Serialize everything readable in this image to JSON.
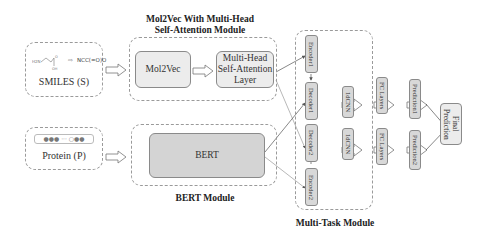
{
  "inputs": {
    "smiles": {
      "label": "SMILES (S)",
      "molecule_sketch": "H2N-CH2-C(=O)-OH",
      "smiles_string": "NCC(=O)O"
    },
    "protein": {
      "label": "Protein (P)",
      "sequence_glyph": "●●● ··· ○●●"
    }
  },
  "modules": {
    "mol2vec_module": {
      "title_line1": "Mol2Vec With Multi-Head",
      "title_line2": "Self-Attention Module",
      "blocks": [
        "Mol2Vec",
        "Multi-Head Self-Attention Layer"
      ]
    },
    "bert_module": {
      "title": "BERT Module",
      "blocks": [
        "BERT"
      ]
    },
    "multitask_module": {
      "title": "Multi-Task Module",
      "encoders_decoders": [
        "Encoder1",
        "Decoder1",
        "Decoder2",
        "Encoder2"
      ],
      "cnn": [
        "1dCNN",
        "1dCNN"
      ],
      "fc": [
        "FC Layers",
        "FC Layers"
      ],
      "predictions": [
        "Prediction1",
        "Prediction2"
      ],
      "final": "Final Prediction"
    }
  },
  "colors": {
    "block_fill": "#ececec",
    "bert_fill": "#d4d4d4",
    "vertical_block_fill": "#d8d8d8",
    "border": "#8a8a8a",
    "dashed_border": "#9a9a9a"
  }
}
